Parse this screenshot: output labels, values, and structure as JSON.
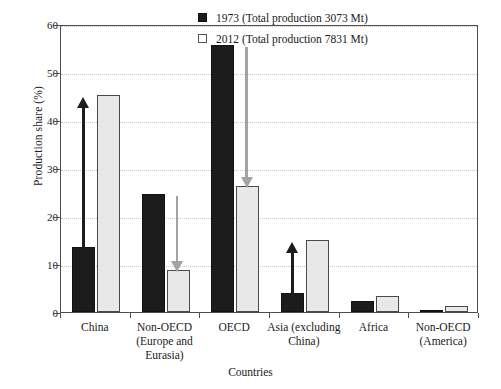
{
  "chart_data": {
    "type": "bar",
    "title": "",
    "xlabel": "Countries",
    "ylabel": "Production share (%)",
    "ylim": [
      0,
      60
    ],
    "yticks": [
      0,
      10,
      20,
      30,
      40,
      50,
      60
    ],
    "grid": true,
    "legend_position": "top-right",
    "categories": [
      "China",
      "Non-OECD (Europe and Eurasia)",
      "OECD",
      "Asia (excluding China)",
      "Africa",
      "Non-OECD (America)"
    ],
    "category_lines": [
      [
        "China"
      ],
      [
        "Non-OECD",
        "(Europe and",
        "Eurasia)"
      ],
      [
        "OECD"
      ],
      [
        "Asia (excluding",
        "China)"
      ],
      [
        "Africa"
      ],
      [
        "Non-OECD",
        "(America)"
      ]
    ],
    "series": [
      {
        "name": "1973 (Total production 3073 Mt)",
        "year": "1973",
        "total_production": "3073 Mt",
        "color": "#1c1c1c",
        "values": [
          13.5,
          24.5,
          55.7,
          4.0,
          2.2,
          0.3
        ]
      },
      {
        "name": "2012 (Total production 7831 Mt)",
        "year": "2012",
        "total_production": "7831 Mt",
        "color": "#e8e8e8",
        "values": [
          45.2,
          8.7,
          26.2,
          15.1,
          3.3,
          1.3
        ]
      }
    ],
    "annotations": [
      {
        "category": "China",
        "direction": "up",
        "color": "#1c1c1c",
        "from": 13.5,
        "to": 45.2
      },
      {
        "category": "Non-OECD (Europe and Eurasia)",
        "direction": "down",
        "color": "#a3a3a3",
        "from": 24.5,
        "to": 8.7
      },
      {
        "category": "OECD",
        "direction": "down",
        "color": "#a3a3a3",
        "from": 55.7,
        "to": 26.2
      },
      {
        "category": "Asia (excluding China)",
        "direction": "up",
        "color": "#1c1c1c",
        "from": 4.0,
        "to": 15.1
      }
    ]
  },
  "legend": {
    "items": [
      {
        "label": "1973 (Total production 3073 Mt)",
        "swatch": "dark"
      },
      {
        "label": "2012 (Total production 7831 Mt)",
        "swatch": "light"
      }
    ]
  },
  "axes": {
    "y_title": "Production share (%)",
    "x_title": "Countries",
    "y_ticks": [
      "0",
      "10",
      "20",
      "30",
      "40",
      "50",
      "60"
    ]
  }
}
